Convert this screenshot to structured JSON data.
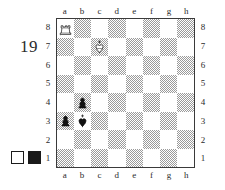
{
  "diagram": {
    "number": "19",
    "files": [
      "a",
      "b",
      "c",
      "d",
      "e",
      "f",
      "g",
      "h"
    ],
    "ranks": [
      "8",
      "7",
      "6",
      "5",
      "4",
      "3",
      "2",
      "1"
    ],
    "colors": {
      "light_square": "#ffffff",
      "dark_square": "#b5b5b5",
      "border": "#3a3a3a",
      "text": "#2b2b2b",
      "piece_black": "#111111",
      "piece_white_fill": "#ffffff",
      "piece_outline": "#111111"
    },
    "color_key": {
      "white_label": "white",
      "black_label": "black"
    }
  },
  "chart_data": {
    "type": "table",
    "files": [
      "a",
      "b",
      "c",
      "d",
      "e",
      "f",
      "g",
      "h"
    ],
    "ranks": [
      "8",
      "7",
      "6",
      "5",
      "4",
      "3",
      "2",
      "1"
    ],
    "pieces": [
      {
        "square": "a8",
        "file": "a",
        "rank": "8",
        "color": "white",
        "type": "rook",
        "glyph": "♖"
      },
      {
        "square": "c7",
        "file": "c",
        "rank": "7",
        "color": "white",
        "type": "king",
        "glyph": "♔"
      },
      {
        "square": "b4",
        "file": "b",
        "rank": "4",
        "color": "black",
        "type": "pawn",
        "glyph": "♟"
      },
      {
        "square": "a3",
        "file": "a",
        "rank": "3",
        "color": "black",
        "type": "pawn",
        "glyph": "♟"
      },
      {
        "square": "b3",
        "file": "b",
        "rank": "3",
        "color": "black",
        "type": "king",
        "glyph": "♚"
      }
    ],
    "fen": "R7/2K5/8/8/1p6/pk6/8/8",
    "piece_count": 5
  }
}
